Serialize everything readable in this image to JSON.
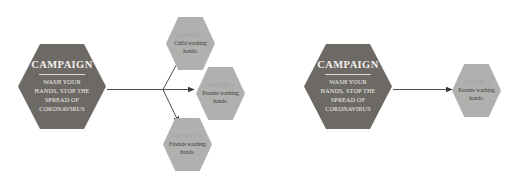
{
  "canvas": {
    "width": 528,
    "height": 181,
    "background": "#ffffff"
  },
  "colors": {
    "campaign_fill": "#6d6a66",
    "campaign_text": "#f2f0ee",
    "advert_fill": "#b0b0ae",
    "advert_title_text": "#a0a09e",
    "advert_body_text": "#3d3d3b",
    "connector": "#3a3a3a"
  },
  "diagrams": [
    {
      "id": "branching",
      "name": "campaign-to-three-adverts",
      "campaign": {
        "title": "CAMPAIGN",
        "subtitle": "WASH YOUR HANDS, STOP THE SPREAD OF CORONAVIRUS"
      },
      "adverts": [
        {
          "title": "ADVERT 1",
          "body": "Child washing hands."
        },
        {
          "title": "ADVERT 2",
          "body": "Parents washing hands."
        },
        {
          "title": "ADVERT 3",
          "body": "Friends washing hands."
        }
      ],
      "connector_type": "three-way-branch"
    },
    {
      "id": "single",
      "name": "campaign-to-one-advert",
      "campaign": {
        "title": "CAMPAIGN",
        "subtitle": "WASH YOUR HANDS, STOP THE SPREAD OF CORONAVIRUS"
      },
      "adverts": [
        {
          "title": "ADVERT 1",
          "body": "Parents washing hands."
        }
      ],
      "connector_type": "single-arrow"
    }
  ]
}
